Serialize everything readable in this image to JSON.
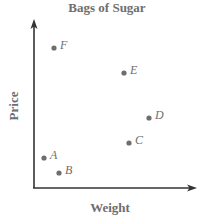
{
  "chart_data": {
    "type": "scatter",
    "title": "Bags of Sugar",
    "xlabel": "Weight",
    "ylabel": "Price",
    "grid": false,
    "legend": null,
    "axis_ticks": "none (unlabeled axes with arrowheads)",
    "points": [
      {
        "label": "A",
        "x": 1.0,
        "y": 3.0
      },
      {
        "label": "B",
        "x": 2.5,
        "y": 1.5
      },
      {
        "label": "C",
        "x": 9.5,
        "y": 4.5
      },
      {
        "label": "D",
        "x": 11.5,
        "y": 7.0
      },
      {
        "label": "E",
        "x": 9.0,
        "y": 11.5
      },
      {
        "label": "F",
        "x": 2.0,
        "y": 14.0
      }
    ],
    "xlim": [
      0,
      16
    ],
    "ylim": [
      0,
      16
    ]
  },
  "colors": {
    "axis": "#333333",
    "point": "#6e6e6e",
    "text": "#6e6e6e"
  }
}
